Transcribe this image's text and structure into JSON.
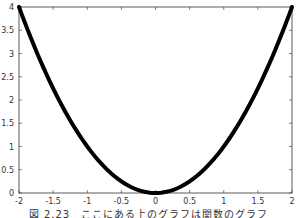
{
  "chart_data": {
    "type": "line",
    "title": "",
    "xlabel": "",
    "ylabel": "",
    "xlim": [
      -2,
      2
    ],
    "ylim": [
      0,
      4
    ],
    "grid": false,
    "legend": null,
    "x_ticks": [
      "-2",
      "-1.5",
      "-1",
      "-0.5",
      "0",
      "0.5",
      "1",
      "1.5",
      "2"
    ],
    "y_ticks": [
      "0",
      "0.5",
      "1",
      "1.5",
      "2",
      "2.5",
      "3",
      "3.5",
      "4"
    ],
    "series": [
      {
        "name": "y = x^2",
        "color": "#000000",
        "x": [
          -2,
          -1.75,
          -1.5,
          -1.25,
          -1,
          -0.75,
          -0.5,
          -0.25,
          0,
          0.25,
          0.5,
          0.75,
          1,
          1.25,
          1.5,
          1.75,
          2
        ],
        "y": [
          4,
          3.0625,
          2.25,
          1.5625,
          1,
          0.5625,
          0.25,
          0.0625,
          0,
          0.0625,
          0.25,
          0.5625,
          1,
          1.5625,
          2.25,
          3.0625,
          4
        ]
      }
    ],
    "caption": "図 2.23: ..."
  },
  "caption": "図 2.23　ここにある上のグラフは関数のグラフ"
}
